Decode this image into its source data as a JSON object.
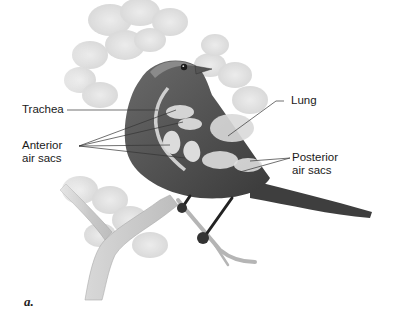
{
  "figure": {
    "panel_label": "a.",
    "labels": {
      "trachea": "Trachea",
      "anterior_line1": "Anterior",
      "anterior_line2": "air sacs",
      "lung": "Lung",
      "posterior_line1": "Posterior",
      "posterior_line2": "air sacs"
    }
  }
}
